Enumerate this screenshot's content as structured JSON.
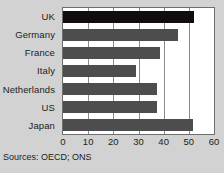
{
  "chart_data": {
    "type": "bar",
    "orientation": "horizontal",
    "title": "",
    "xlabel": "",
    "ylabel": "",
    "categories": [
      "UK",
      "Germany",
      "France",
      "Italy",
      "Netherlands",
      "US",
      "Japan"
    ],
    "values": [
      52,
      45.5,
      38.5,
      29,
      37.5,
      37.5,
      51.5
    ],
    "series": [
      {
        "name": "",
        "values": [
          52,
          45.5,
          38.5,
          29,
          37.5,
          37.5,
          51.5
        ]
      }
    ],
    "xlim": [
      0,
      60
    ],
    "xticks": [
      0,
      10,
      20,
      30,
      40,
      50,
      60
    ],
    "xtick_labels": [
      "0",
      "10",
      "20",
      "30",
      "40",
      "50",
      "60"
    ],
    "grid": true,
    "grid_axis": "x",
    "legend": false,
    "highlight_category": "UK",
    "colors": {
      "bar": "#4d4d4d",
      "bar_highlight": "#120d0d",
      "plot_background": "#ffffff",
      "figure_background": "#d2d2d2",
      "gridline": "#8c8c8c",
      "axis_frame": "#6e6e6e",
      "text": "#1c1c1c"
    }
  },
  "notes": {
    "source": "Sources: OECD; ONS"
  }
}
